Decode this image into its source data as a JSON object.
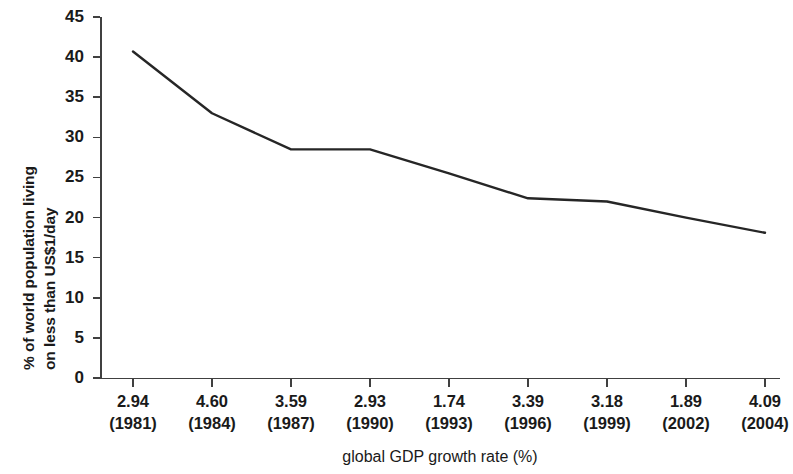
{
  "chart_data": {
    "type": "line",
    "title": "",
    "xlabel": "global GDP growth rate (%)",
    "ylabel": "% of world population living on less than US$1/day",
    "ylabel_line1": "% of world population living",
    "ylabel_line2": "on less than US$1/day",
    "categories": [
      "2.94 (1981)",
      "4.60 (1984)",
      "3.59 (1987)",
      "2.93 (1990)",
      "1.74 (1993)",
      "3.39 (1996)",
      "3.18 (1999)",
      "1.89 (2002)",
      "4.09 (2004)"
    ],
    "growth_rates": [
      "2.94",
      "4.60",
      "3.59",
      "2.93",
      "1.74",
      "3.39",
      "3.18",
      "1.89",
      "4.09"
    ],
    "years": [
      "(1981)",
      "(1984)",
      "(1987)",
      "(1990)",
      "(1993)",
      "(1996)",
      "(1999)",
      "(2002)",
      "(2004)"
    ],
    "values": [
      40.7,
      33.0,
      28.5,
      28.5,
      25.5,
      22.4,
      22.0,
      20.0,
      18.1
    ],
    "ylim": [
      0,
      45
    ],
    "yticks": [
      "0",
      "5",
      "10",
      "15",
      "20",
      "25",
      "30",
      "35",
      "40",
      "45"
    ],
    "ytick_values": [
      0,
      5,
      10,
      15,
      20,
      25,
      30,
      35,
      40,
      45
    ],
    "grid": false,
    "legend": false,
    "legend_position": "none",
    "line_color": "#262626",
    "background_color": "#ffffff",
    "axis_color": "#404040"
  }
}
